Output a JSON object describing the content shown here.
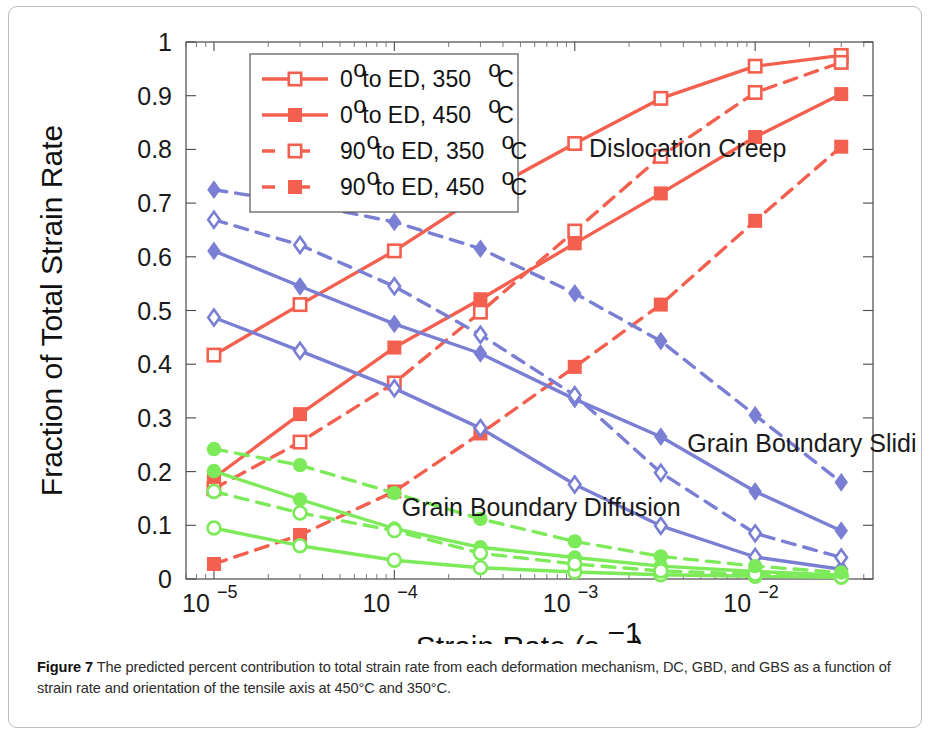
{
  "caption": {
    "figure_label": "Figure 7",
    "text": " The predicted percent contribution to total strain rate from each deformation mechanism, DC, GBD, and GBS as a function of strain rate and orientation of the tensile axis at 450°C and 350°C."
  },
  "colors": {
    "dislocation_creep": "#f4604f",
    "grain_boundary_sliding": "#7b7fd4",
    "grain_boundary_diffusion": "#7dea5a",
    "axis": "#4a4a4a",
    "text": "#1a1a1a",
    "card_border": "#b9bcc0",
    "background": "#ffffff"
  },
  "legend": {
    "entries": [
      {
        "label": "0° to ED, 350°C",
        "deg": "0",
        "rest": " to ED, 350",
        "unit": "C",
        "style": "solid",
        "marker": "open-square",
        "color": "#f4604f"
      },
      {
        "label": "0° to ED, 450°C",
        "deg": "0",
        "rest": " to ED, 450",
        "unit": "C",
        "style": "solid",
        "marker": "filled-square",
        "color": "#f4604f"
      },
      {
        "label": "90° to ED, 350°C",
        "deg": "90",
        "rest": " to ED, 350",
        "unit": "C",
        "style": "dashed",
        "marker": "open-square",
        "color": "#f4604f"
      },
      {
        "label": "90° to ED, 450°C",
        "deg": "90",
        "rest": " to ED, 450",
        "unit": "C",
        "style": "dashed",
        "marker": "filled-square",
        "color": "#f4604f"
      }
    ]
  },
  "annotations": [
    {
      "text": "Dislocation Creep",
      "x": 0.0012,
      "y": 0.785
    },
    {
      "text": "Grain Boundary Sliding",
      "x": 0.0042,
      "y": 0.237
    },
    {
      "text": "Grain Boundary Diffusion",
      "x": 0.00011,
      "y": 0.118
    }
  ],
  "chart_data": {
    "type": "line",
    "title": "",
    "xlabel": "Strain Rate (s⁻¹)",
    "ylabel": "Fraction of Total Strain Rate",
    "xscale": "log",
    "xlim": [
      7e-06,
      0.045
    ],
    "ylim": [
      0,
      1
    ],
    "yticks": [
      0,
      0.1,
      0.2,
      0.3,
      0.4,
      0.5,
      0.6,
      0.7,
      0.8,
      0.9,
      1
    ],
    "ytick_labels": [
      "0",
      "0.1",
      "0.2",
      "0.3",
      "0.4",
      "0.5",
      "0.6",
      "0.7",
      "0.8",
      "0.9",
      "1"
    ],
    "xticks": [
      1e-05,
      0.0001,
      0.001,
      0.01
    ],
    "xtick_labels": [
      "10⁻⁵",
      "10⁻⁴",
      "10⁻³",
      "10⁻²"
    ],
    "grid": false,
    "legend_position": "upper-left-inside",
    "x": [
      1e-05,
      3e-05,
      0.0001,
      0.0003,
      0.001,
      0.003,
      0.01,
      0.03
    ],
    "series": [
      {
        "name": "Dislocation Creep, 0° to ED, 350°C",
        "mechanism": "Dislocation Creep",
        "color": "#f4604f",
        "style": "solid",
        "marker": "open-square",
        "values": [
          0.417,
          0.511,
          0.611,
          0.715,
          0.811,
          0.895,
          0.955,
          0.975
        ]
      },
      {
        "name": "Dislocation Creep, 0° to ED, 450°C",
        "mechanism": "Dislocation Creep",
        "color": "#f4604f",
        "style": "solid",
        "marker": "filled-square",
        "values": [
          0.188,
          0.307,
          0.431,
          0.521,
          0.625,
          0.718,
          0.823,
          0.903
        ]
      },
      {
        "name": "Dislocation Creep, 90° to ED, 350°C",
        "mechanism": "Dislocation Creep",
        "color": "#f4604f",
        "style": "dashed",
        "marker": "open-square",
        "values": [
          0.168,
          0.255,
          0.365,
          0.497,
          0.648,
          0.787,
          0.906,
          0.962
        ]
      },
      {
        "name": "Dislocation Creep, 90° to ED, 450°C",
        "mechanism": "Dislocation Creep",
        "color": "#f4604f",
        "style": "dashed",
        "marker": "filled-square",
        "values": [
          0.028,
          0.082,
          0.163,
          0.271,
          0.395,
          0.511,
          0.667,
          0.805
        ]
      },
      {
        "name": "Grain Boundary Sliding, 0° to ED, 350°C",
        "mechanism": "Grain Boundary Sliding",
        "color": "#7b7fd4",
        "style": "solid",
        "marker": "open-diamond",
        "values": [
          0.487,
          0.425,
          0.355,
          0.281,
          0.176,
          0.099,
          0.041,
          0.018
        ]
      },
      {
        "name": "Grain Boundary Sliding, 0° to ED, 450°C",
        "mechanism": "Grain Boundary Sliding",
        "color": "#7b7fd4",
        "style": "solid",
        "marker": "filled-diamond",
        "values": [
          0.611,
          0.545,
          0.475,
          0.42,
          0.335,
          0.265,
          0.163,
          0.09
        ]
      },
      {
        "name": "Grain Boundary Sliding, 90° to ED, 350°C",
        "mechanism": "Grain Boundary Sliding",
        "color": "#7b7fd4",
        "style": "dashed",
        "marker": "open-diamond",
        "values": [
          0.669,
          0.622,
          0.545,
          0.455,
          0.342,
          0.198,
          0.085,
          0.04
        ]
      },
      {
        "name": "Grain Boundary Sliding, 90° to ED, 450°C",
        "mechanism": "Grain Boundary Sliding",
        "color": "#7b7fd4",
        "style": "dashed",
        "marker": "filled-diamond",
        "values": [
          0.725,
          0.7,
          0.665,
          0.615,
          0.532,
          0.443,
          0.305,
          0.18
        ]
      },
      {
        "name": "Grain Boundary Diffusion, 0° to ED, 350°C",
        "mechanism": "Grain Boundary Diffusion",
        "color": "#7dea5a",
        "style": "solid",
        "marker": "open-circle",
        "values": [
          0.095,
          0.062,
          0.035,
          0.021,
          0.013,
          0.008,
          0.005,
          0.003
        ]
      },
      {
        "name": "Grain Boundary Diffusion, 0° to ED, 450°C",
        "mechanism": "Grain Boundary Diffusion",
        "color": "#7dea5a",
        "style": "solid",
        "marker": "filled-circle",
        "values": [
          0.201,
          0.148,
          0.094,
          0.059,
          0.04,
          0.024,
          0.014,
          0.007
        ]
      },
      {
        "name": "Grain Boundary Diffusion, 90° to ED, 350°C",
        "mechanism": "Grain Boundary Diffusion",
        "color": "#7dea5a",
        "style": "dashed",
        "marker": "open-circle",
        "values": [
          0.163,
          0.123,
          0.09,
          0.048,
          0.028,
          0.015,
          0.009,
          0.004
        ]
      },
      {
        "name": "Grain Boundary Diffusion, 90° to ED, 450°C",
        "mechanism": "Grain Boundary Diffusion",
        "color": "#7dea5a",
        "style": "dashed",
        "marker": "filled-circle",
        "values": [
          0.242,
          0.212,
          0.16,
          0.112,
          0.07,
          0.042,
          0.024,
          0.012
        ]
      }
    ]
  }
}
